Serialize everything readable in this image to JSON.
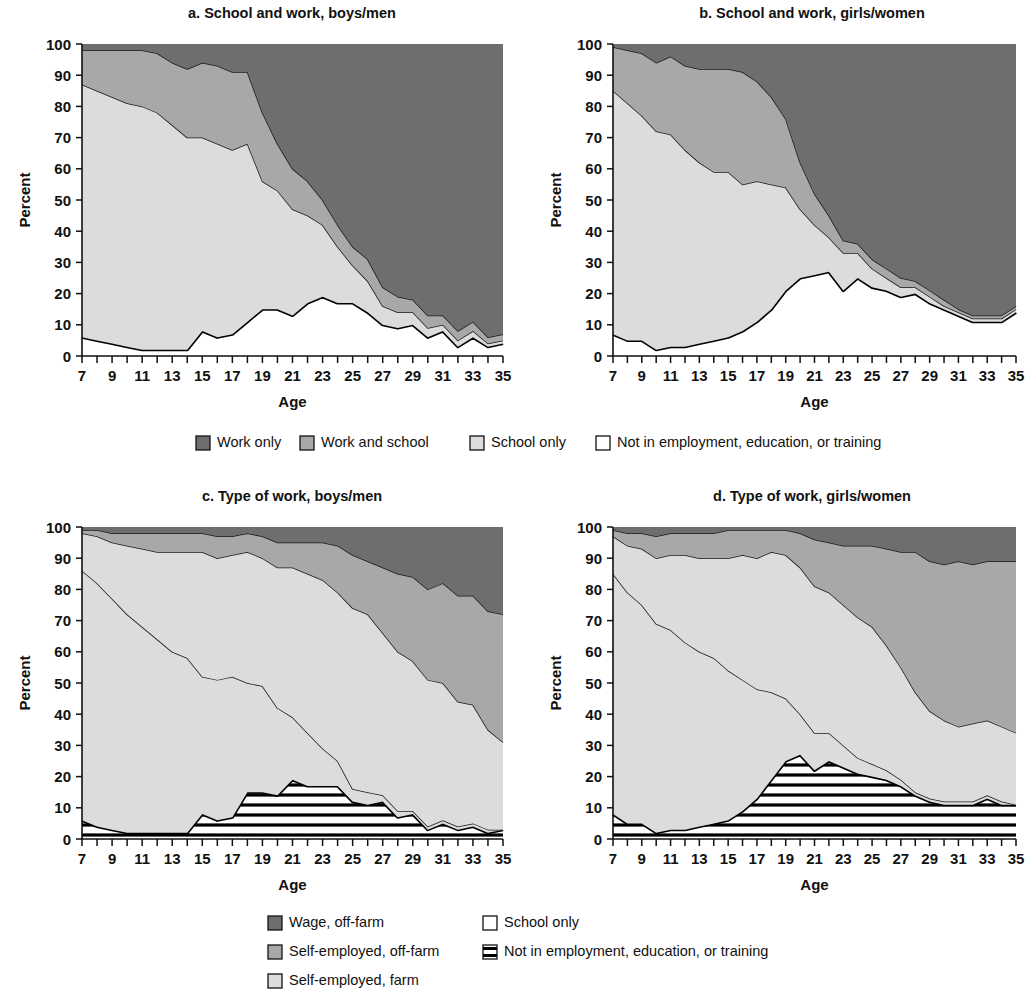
{
  "figure": {
    "axis_y_label": "Percent",
    "axis_x_label": "Age",
    "y_ticks": [
      "0",
      "10",
      "20",
      "30",
      "40",
      "50",
      "60",
      "70",
      "80",
      "90",
      "100"
    ],
    "x_ticks": [
      "7",
      "9",
      "11",
      "13",
      "15",
      "17",
      "19",
      "21",
      "23",
      "25",
      "27",
      "29",
      "31",
      "33",
      "35"
    ]
  },
  "panels": {
    "a": {
      "title": "a. School and work, boys/men"
    },
    "b": {
      "title": "b. School and work, girls/women"
    },
    "c": {
      "title": "c. Type of work, boys/men"
    },
    "d": {
      "title": "d. Type of work, girls/women"
    }
  },
  "legend_top": {
    "items": [
      {
        "label": "Work only",
        "swatch": "dark-gray-fill",
        "color": "#6e6e6e"
      },
      {
        "label": "Work and school",
        "swatch": "medium-gray-fill",
        "color": "#a8a8a8"
      },
      {
        "label": "School only",
        "swatch": "light-gray-fill",
        "color": "#dcdcdc"
      },
      {
        "label": "Not in employment, education, or training",
        "swatch": "white-fill",
        "color": "#ffffff"
      }
    ]
  },
  "legend_bottom": {
    "items": [
      {
        "label": "Wage, off-farm",
        "swatch": "dark-gray-fill",
        "color": "#6e6e6e"
      },
      {
        "label": "Self-employed, off-farm",
        "swatch": "medium-gray-fill",
        "color": "#a8a8a8"
      },
      {
        "label": "Self-employed, farm",
        "swatch": "light-gray-fill",
        "color": "#dcdcdc"
      },
      {
        "label": "School only",
        "swatch": "white-fill",
        "color": "#ffffff"
      },
      {
        "label": "Not in employment, education, or training",
        "swatch": "horizontal-stripe-fill",
        "color": "#000000"
      }
    ]
  },
  "colors": {
    "dark_gray": "#6e6e6e",
    "medium_gray": "#a8a8a8",
    "light_gray": "#dcdcdc",
    "white": "#ffffff",
    "ink": "#111111"
  },
  "chart_data": {
    "type": "area",
    "xlabel": "Age",
    "ylabel": "Percent",
    "xlim": [
      7,
      35
    ],
    "ylim": [
      0,
      100
    ],
    "grid": false,
    "stacked": true,
    "stack_total": 100,
    "legend_position": "below-panels",
    "x": [
      7,
      8,
      9,
      10,
      11,
      12,
      13,
      14,
      15,
      16,
      17,
      18,
      19,
      20,
      21,
      22,
      23,
      24,
      25,
      26,
      27,
      28,
      29,
      30,
      31,
      32,
      33,
      34,
      35
    ],
    "panels": [
      {
        "key": "a",
        "title": "a. School and work, boys/men",
        "series": [
          {
            "name": "Not in employment, education, or training",
            "values": [
              6,
              5,
              4,
              3,
              2,
              2,
              2,
              2,
              8,
              6,
              7,
              11,
              15,
              15,
              13,
              17,
              19,
              17,
              17,
              14,
              10,
              9,
              10,
              6,
              8,
              3,
              6,
              3,
              4,
              2,
              3
            ]
          },
          {
            "name": "School only",
            "values": [
              81,
              80,
              79,
              78,
              78,
              76,
              72,
              68,
              62,
              62,
              59,
              57,
              41,
              38,
              34,
              28,
              23,
              18,
              12,
              10,
              6,
              5,
              4,
              3,
              2,
              2,
              2,
              1,
              1
            ]
          },
          {
            "name": "Work and school",
            "values": [
              11,
              13,
              15,
              17,
              18,
              19,
              20,
              22,
              24,
              25,
              25,
              23,
              22,
              15,
              13,
              11,
              8,
              7,
              6,
              7,
              6,
              5,
              4,
              4,
              3,
              3,
              3,
              2,
              2
            ]
          },
          {
            "name": "Work only",
            "values": [
              2,
              2,
              2,
              2,
              2,
              3,
              6,
              8,
              6,
              7,
              9,
              9,
              22,
              32,
              40,
              44,
              50,
              58,
              65,
              69,
              78,
              81,
              82,
              87,
              87,
              92,
              89,
              94,
              94
            ]
          }
        ],
        "neet_line": [
          6,
          5,
          4,
          3,
          2,
          2,
          2,
          2,
          8,
          6,
          7,
          11,
          15,
          15,
          13,
          17,
          19,
          17,
          17,
          14,
          10,
          9,
          10,
          6,
          8,
          3,
          6,
          3,
          4,
          2,
          3
        ]
      },
      {
        "key": "b",
        "title": "b. School and work, girls/women",
        "series": [
          {
            "name": "Not in employment, education, or training",
            "values": [
              7,
              5,
              5,
              2,
              3,
              3,
              4,
              5,
              6,
              8,
              11,
              15,
              21,
              25,
              26,
              27,
              21,
              25,
              22,
              21,
              19,
              20,
              17,
              15,
              13,
              11,
              11,
              11,
              14,
              11
            ]
          },
          {
            "name": "School only",
            "values": [
              78,
              76,
              72,
              70,
              68,
              63,
              58,
              54,
              53,
              47,
              45,
              40,
              33,
              22,
              16,
              11,
              12,
              8,
              6,
              4,
              3,
              2,
              2,
              1,
              1,
              1,
              1,
              1,
              1
            ]
          },
          {
            "name": "Work and school",
            "values": [
              14,
              17,
              20,
              22,
              25,
              27,
              30,
              33,
              33,
              36,
              32,
              28,
              22,
              15,
              10,
              7,
              4,
              3,
              3,
              3,
              3,
              2,
              2,
              2,
              1,
              1,
              1,
              1,
              1
            ]
          },
          {
            "name": "Work only",
            "values": [
              1,
              2,
              3,
              6,
              4,
              7,
              8,
              8,
              8,
              9,
              12,
              17,
              24,
              38,
              48,
              55,
              63,
              64,
              69,
              72,
              75,
              76,
              79,
              82,
              85,
              87,
              87,
              87,
              84
            ]
          }
        ],
        "neet_line": [
          7,
          5,
          5,
          2,
          3,
          3,
          4,
          5,
          6,
          8,
          11,
          15,
          21,
          25,
          26,
          27,
          21,
          25,
          22,
          21,
          19,
          20,
          17,
          15,
          13,
          11,
          11,
          11,
          14,
          11
        ]
      },
      {
        "key": "c",
        "title": "c. Type of work, boys/men",
        "series": [
          {
            "name": "Not in employment, education, or training",
            "values": [
              6,
              4,
              3,
              2,
              2,
              2,
              2,
              2,
              8,
              6,
              7,
              15,
              15,
              14,
              19,
              17,
              17,
              17,
              12,
              11,
              12,
              7,
              8,
              3,
              5,
              3,
              4,
              2,
              3
            ]
          },
          {
            "name": "School only",
            "values": [
              80,
              78,
              74,
              70,
              66,
              62,
              58,
              56,
              44,
              45,
              45,
              35,
              34,
              28,
              20,
              17,
              12,
              8,
              4,
              4,
              2,
              2,
              1,
              1,
              1,
              1,
              1,
              1,
              0
            ]
          },
          {
            "name": "Self-employed, farm",
            "values": [
              12,
              15,
              18,
              22,
              25,
              28,
              32,
              34,
              40,
              39,
              39,
              42,
              41,
              45,
              48,
              51,
              54,
              54,
              58,
              57,
              52,
              51,
              48,
              47,
              44,
              40,
              38,
              32,
              28
            ]
          },
          {
            "name": "Self-employed, off-farm",
            "values": [
              1,
              2,
              3,
              4,
              5,
              6,
              6,
              6,
              6,
              7,
              6,
              6,
              7,
              8,
              8,
              10,
              12,
              15,
              17,
              17,
              21,
              25,
              27,
              29,
              32,
              34,
              35,
              38,
              41
            ]
          },
          {
            "name": "Wage, off-farm",
            "values": [
              1,
              1,
              2,
              2,
              2,
              2,
              2,
              2,
              2,
              3,
              3,
              2,
              3,
              5,
              5,
              5,
              5,
              6,
              9,
              11,
              13,
              15,
              16,
              20,
              18,
              22,
              22,
              27,
              28
            ]
          }
        ],
        "neet_line": [
          6,
          4,
          3,
          2,
          2,
          2,
          2,
          2,
          8,
          6,
          7,
          15,
          15,
          14,
          19,
          17,
          17,
          17,
          12,
          11,
          12,
          7,
          8,
          3,
          5,
          3,
          4,
          2,
          3
        ]
      },
      {
        "key": "d",
        "title": "d. Type of work, girls/women",
        "series": [
          {
            "name": "Not in employment, education, or training",
            "values": [
              8,
              5,
              5,
              2,
              3,
              3,
              4,
              5,
              6,
              9,
              13,
              19,
              25,
              27,
              22,
              25,
              23,
              21,
              20,
              19,
              17,
              14,
              12,
              11,
              11,
              11,
              13,
              11,
              11
            ]
          },
          {
            "name": "School only",
            "values": [
              77,
              74,
              70,
              67,
              64,
              60,
              56,
              53,
              48,
              42,
              35,
              28,
              20,
              13,
              12,
              9,
              7,
              5,
              4,
              3,
              2,
              1,
              1,
              1,
              1,
              1,
              1,
              1,
              0
            ]
          },
          {
            "name": "Self-employed, farm",
            "values": [
              12,
              15,
              18,
              21,
              24,
              28,
              30,
              32,
              36,
              40,
              42,
              45,
              46,
              47,
              47,
              45,
              45,
              45,
              44,
              40,
              36,
              32,
              28,
              26,
              24,
              25,
              24,
              24,
              23
            ]
          },
          {
            "name": "Self-employed, off-farm",
            "values": [
              2,
              4,
              5,
              7,
              7,
              7,
              8,
              8,
              9,
              8,
              9,
              7,
              8,
              11,
              15,
              16,
              19,
              23,
              26,
              31,
              37,
              45,
              48,
              50,
              53,
              51,
              51,
              53,
              55
            ]
          },
          {
            "name": "Wage, off-farm",
            "values": [
              1,
              2,
              2,
              3,
              2,
              2,
              2,
              2,
              1,
              1,
              1,
              1,
              1,
              2,
              4,
              5,
              6,
              6,
              6,
              7,
              8,
              8,
              11,
              12,
              11,
              12,
              11,
              11,
              11
            ]
          }
        ],
        "neet_line": [
          8,
          5,
          5,
          2,
          3,
          3,
          4,
          5,
          6,
          9,
          13,
          19,
          25,
          27,
          22,
          25,
          23,
          21,
          20,
          19,
          17,
          14,
          12,
          11,
          11,
          11,
          13,
          11,
          11
        ]
      }
    ]
  }
}
